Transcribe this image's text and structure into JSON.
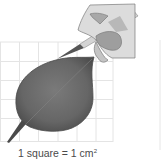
{
  "figure": {
    "grid": {
      "x0": 0,
      "y0": 42,
      "cell_px": 19.2,
      "cols": 6,
      "rows": 5,
      "line_color": "#e4e4e4"
    },
    "leaf_color": "#6a6a6a",
    "leaf_highlight": "#8a8a8a",
    "hand_color": "#d9d9d9",
    "hand_shadow": "#a9a9a9",
    "pen_color": "#c8c8c8",
    "right_rule_color": "#e6e6e6"
  },
  "caption": {
    "prefix": "1 square = 1 cm",
    "superscript": "2"
  }
}
